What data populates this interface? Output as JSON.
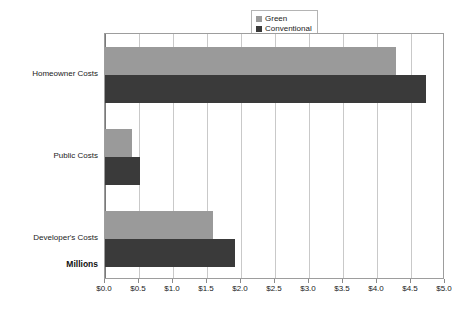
{
  "chart_data": {
    "type": "bar",
    "orientation": "horizontal",
    "title": "",
    "subtitle": "",
    "xlabel": "Millions",
    "ylabel": "",
    "categories": [
      "Homeowner Costs",
      "Public Costs",
      "Developer's Costs"
    ],
    "series": [
      {
        "name": "Green",
        "color": "#9a9a9a",
        "values": [
          4.28,
          0.39,
          1.59
        ]
      },
      {
        "name": "Conventional",
        "color": "#3a3a3a",
        "values": [
          4.72,
          0.51,
          1.91
        ]
      }
    ],
    "xlim": [
      0.0,
      5.0
    ],
    "xticks": [
      0.0,
      0.5,
      1.0,
      1.5,
      2.0,
      2.5,
      3.0,
      3.5,
      4.0,
      4.5,
      5.0
    ],
    "xtick_labels": [
      "$0.0",
      "$0.5",
      "$1.0",
      "$1.5",
      "$2.0",
      "$2.5",
      "$3.0",
      "$3.5",
      "$4.0",
      "$4.5",
      "$5.0"
    ],
    "grid": true,
    "grid_axis": "x",
    "legend_position": "top-right",
    "plot_background": "#ffffff",
    "grid_color": "#c9c9c9",
    "border_color": "#9d9d9d"
  },
  "legend": {
    "entries": [
      {
        "label": "Green",
        "color": "#9a9a9a"
      },
      {
        "label": "Conventional",
        "color": "#3a3a3a"
      }
    ]
  },
  "axis": {
    "units_label": "Millions"
  }
}
